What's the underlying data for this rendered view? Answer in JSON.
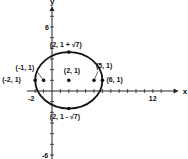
{
  "chart_data": {
    "type": "scatter",
    "title": "",
    "xlabel": "x",
    "ylabel": "y",
    "xlim": [
      -3,
      14
    ],
    "ylim": [
      -7,
      8
    ],
    "x_ticks": {
      "step": 1,
      "labeled": [
        {
          "value": -2,
          "label": "-2"
        },
        {
          "value": 12,
          "label": "12"
        }
      ]
    },
    "y_ticks": {
      "step": 1,
      "labeled": [
        {
          "value": 6,
          "label": "6"
        },
        {
          "value": -6,
          "label": "-6"
        }
      ]
    },
    "curve": {
      "type": "ellipse",
      "center": [
        2,
        1
      ],
      "semi_major_x": 4,
      "semi_minor_y": 2.6458,
      "color": "#111111"
    },
    "points": [
      {
        "x": 2,
        "y": 1,
        "label": "(2, 1)"
      },
      {
        "x": -1,
        "y": 1,
        "label": "(-1, 1)"
      },
      {
        "x": 5,
        "y": 1,
        "label": "(5, 1)"
      },
      {
        "x": -2,
        "y": 1,
        "label": "(-2, 1)"
      },
      {
        "x": 6,
        "y": 1,
        "label": "(6, 1)"
      },
      {
        "x": 2,
        "y": 3.6458,
        "label": "(2, 1 + √7)"
      },
      {
        "x": 2,
        "y": -1.6458,
        "label": "(2, 1 - √7)"
      }
    ]
  }
}
